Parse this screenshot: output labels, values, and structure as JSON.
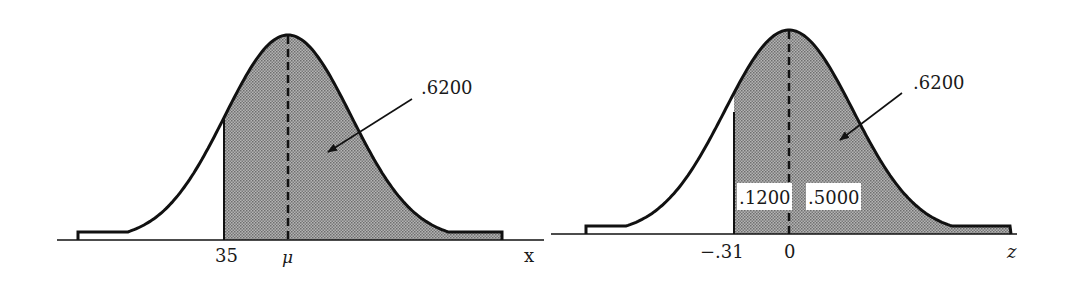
{
  "figure": {
    "left_panel": {
      "axis_label": "x",
      "tick_labels": {
        "lower_bound": "35",
        "mean": "μ"
      },
      "area_label": ".6200",
      "shade_from": 35,
      "shaded_area": 0.62
    },
    "right_panel": {
      "axis_label": "z",
      "tick_labels": {
        "lower_bound": "−.31",
        "mean": "0"
      },
      "area_label": ".6200",
      "sub_area_labels": {
        "left_of_mean": ".1200",
        "right_of_mean": ".5000"
      },
      "shade_from": -0.31,
      "shaded_area": 0.62
    },
    "colors": {
      "curve": "#111111",
      "shade": "#9e9e9e",
      "background": "#ffffff"
    }
  }
}
